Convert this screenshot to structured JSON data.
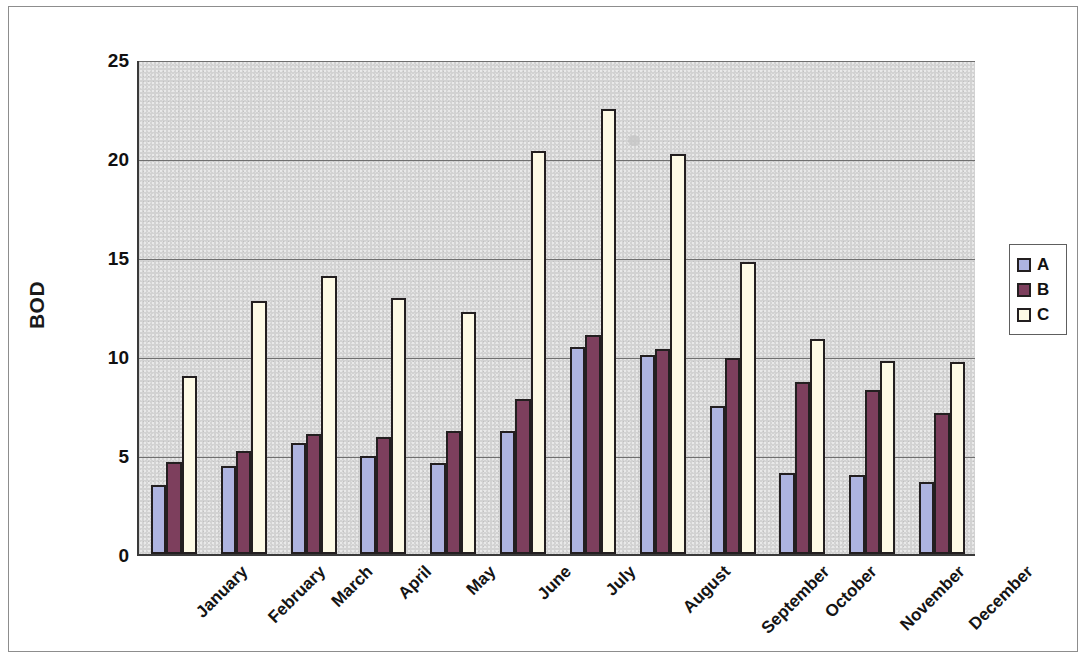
{
  "chart_data": {
    "type": "bar",
    "title": "",
    "xlabel": "",
    "ylabel": "BOD",
    "ylim": [
      0,
      25
    ],
    "yticks": [
      0,
      5,
      10,
      15,
      20,
      25
    ],
    "ytick_labels": [
      "0",
      "5",
      "10",
      "15",
      "20",
      "25"
    ],
    "grid": true,
    "grid_axis": "y",
    "legend_position": "right",
    "categories": [
      "January",
      "February",
      "March",
      "April",
      "May",
      "June",
      "July",
      "August",
      "September",
      "October",
      "November",
      "December"
    ],
    "series": [
      {
        "name": "A",
        "color": "#aeb4e0",
        "values": [
          3.5,
          4.45,
          5.6,
          4.95,
          4.6,
          6.2,
          10.45,
          10.05,
          7.5,
          4.1,
          4.0,
          3.65
        ]
      },
      {
        "name": "B",
        "color": "#7d3f5d",
        "values": [
          4.65,
          5.2,
          6.05,
          5.9,
          6.2,
          7.85,
          11.05,
          10.35,
          9.9,
          8.7,
          8.3,
          7.1
        ]
      },
      {
        "name": "C",
        "color": "#fdfae6",
        "values": [
          9.0,
          12.8,
          14.05,
          12.95,
          12.2,
          20.35,
          22.5,
          20.2,
          14.75,
          10.85,
          9.75,
          9.7
        ]
      }
    ],
    "plot_background": "#d2d2d2",
    "bar_outline_color": "#231f20",
    "axis_color": "#3a3a3a"
  },
  "legend": {
    "entries": [
      {
        "label": "A",
        "color": "#aeb4e0"
      },
      {
        "label": "B",
        "color": "#7d3f5d"
      },
      {
        "label": "C",
        "color": "#fdfae6"
      }
    ]
  },
  "axes": {
    "y_title": "BOD"
  }
}
